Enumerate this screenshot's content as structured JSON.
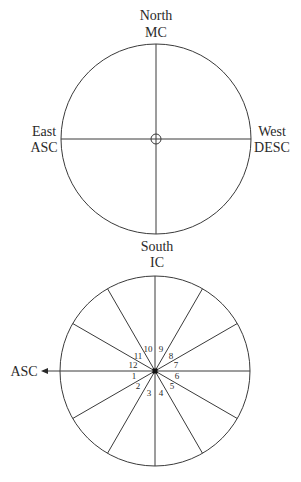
{
  "top_chart": {
    "labels": {
      "north": "North",
      "mc": "MC",
      "east": "East",
      "asc": "ASC",
      "west": "West",
      "desc": "DESC",
      "south": "South",
      "ic": "IC"
    }
  },
  "bottom_chart": {
    "asc_label": "ASC",
    "houses": [
      "1",
      "2",
      "3",
      "4",
      "5",
      "6",
      "7",
      "8",
      "9",
      "10",
      "11",
      "12"
    ]
  },
  "colors": {
    "line": "#3a3a3a",
    "text": "#2a2a2a",
    "background": "#ffffff"
  }
}
